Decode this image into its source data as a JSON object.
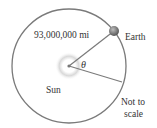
{
  "diagram": {
    "distance_label": "93,000,000 mi",
    "earth_label": "Earth",
    "sun_label": "Sun",
    "angle_label": "θ",
    "note_line1": "Not to",
    "note_line2": "scale"
  },
  "colors": {
    "orbit": "#7a7a7a",
    "earth": "#6f6f6f",
    "sun_glow": "#d8d8d8",
    "text": "#333333"
  }
}
